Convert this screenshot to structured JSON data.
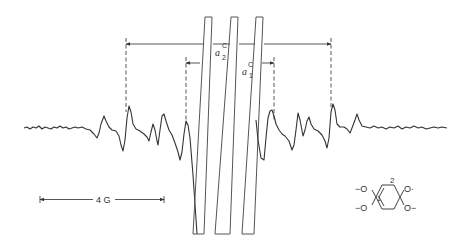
{
  "figure": {
    "type": "EPR spectrum",
    "scale_bar": {
      "label": "4 G"
    },
    "splittings": {
      "outer": {
        "label_main": "a",
        "label_sup": "C",
        "label_sub": "2"
      },
      "inner": {
        "label_main": "a",
        "label_sup": "C",
        "label_sub": "1"
      }
    },
    "molecule": {
      "substituents": {
        "upper_left": "−O",
        "lower_left": "−O",
        "upper_right": "O·",
        "lower_right": "O−"
      },
      "position_labels": {
        "top": "2",
        "left": "1"
      }
    },
    "colors": {
      "ink": "#333333",
      "background": "#ffffff"
    }
  }
}
